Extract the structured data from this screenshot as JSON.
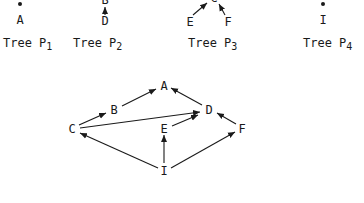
{
  "trees": [
    {
      "id": "P1",
      "caption_prefix": "Tree P",
      "caption_sub": "1",
      "nodes": [
        "A"
      ],
      "root_marker": "dot"
    },
    {
      "id": "P2",
      "caption_prefix": "Tree P",
      "caption_sub": "2",
      "nodes": [
        "B",
        "D"
      ],
      "edges": [
        [
          "D",
          "B"
        ]
      ]
    },
    {
      "id": "P3",
      "caption_prefix": "Tree P",
      "caption_sub": "3",
      "nodes": [
        "C",
        "E",
        "F"
      ],
      "edges": [
        [
          "E",
          "C"
        ],
        [
          "F",
          "C"
        ]
      ]
    },
    {
      "id": "P4",
      "caption_prefix": "Tree P",
      "caption_sub": "4",
      "nodes": [
        "I"
      ],
      "root_marker": "dot"
    }
  ],
  "graph": {
    "nodes": {
      "A": "A",
      "B": "B",
      "C": "C",
      "D": "D",
      "E": "E",
      "F": "F",
      "I": "I"
    },
    "edges": [
      [
        "C",
        "B"
      ],
      [
        "B",
        "A"
      ],
      [
        "D",
        "A"
      ],
      [
        "C",
        "D"
      ],
      [
        "E",
        "D"
      ],
      [
        "F",
        "D"
      ],
      [
        "I",
        "C"
      ],
      [
        "I",
        "E"
      ],
      [
        "I",
        "F"
      ]
    ]
  },
  "colors": {
    "ink": "#1a1a1a",
    "background": "#ffffff"
  }
}
